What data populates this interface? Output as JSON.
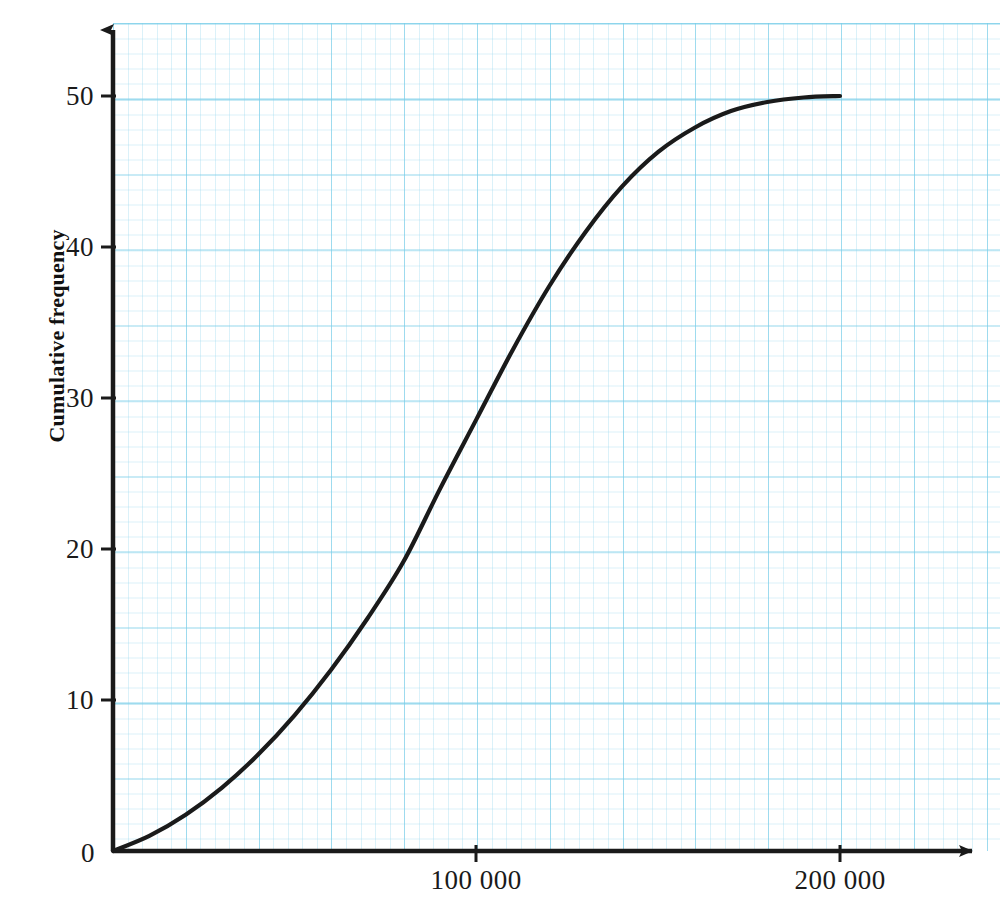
{
  "chart_data": {
    "type": "line",
    "title": "",
    "xlabel": "",
    "ylabel": "Cumulative frequency",
    "xlim": [
      0,
      240000
    ],
    "ylim": [
      0,
      55
    ],
    "grid": true,
    "grid_style": "graph-paper",
    "legend": "none",
    "x_tick_labels": [
      "100 000",
      "200 000"
    ],
    "x_tick_values": [
      100000,
      200000
    ],
    "y_tick_labels": [
      "10",
      "20",
      "30",
      "40",
      "50"
    ],
    "y_tick_values": [
      10,
      20,
      30,
      40,
      50
    ],
    "origin_label": "0",
    "series": [
      {
        "name": "Cumulative frequency",
        "color": "#1a1a1a",
        "x": [
          0,
          10000,
          20000,
          30000,
          40000,
          50000,
          60000,
          70000,
          80000,
          90000,
          100000,
          110000,
          120000,
          130000,
          140000,
          150000,
          160000,
          170000,
          180000,
          190000,
          200000
        ],
        "values": [
          0,
          1.0,
          2.4,
          4.2,
          6.4,
          9.0,
          12.0,
          15.4,
          19.2,
          24.0,
          28.6,
          33.2,
          37.4,
          41.0,
          44.0,
          46.3,
          47.9,
          49.0,
          49.6,
          49.9,
          50.0
        ]
      }
    ],
    "annotations": [
      "S-shaped (ogive) cumulative frequency curve rising from 0 to 50",
      "x-axis drawn with arrowhead at right end",
      "y-axis drawn with arrowhead at top end"
    ]
  },
  "axes": {
    "y_title": "Cumulative frequency",
    "origin": "0",
    "y_ticks": [
      {
        "label": "50",
        "value": 50
      },
      {
        "label": "40",
        "value": 40
      },
      {
        "label": "30",
        "value": 30
      },
      {
        "label": "20",
        "value": 20
      },
      {
        "label": "10",
        "value": 10
      }
    ],
    "x_ticks": [
      {
        "label": "100 000",
        "value": 100000
      },
      {
        "label": "200 000",
        "value": 200000
      }
    ]
  },
  "colors": {
    "curve": "#1a1a1a",
    "axis": "#1a1a1a",
    "grid_major": "#78cde8",
    "grid_minor": "#96d7ee",
    "background": "#ffffff"
  }
}
